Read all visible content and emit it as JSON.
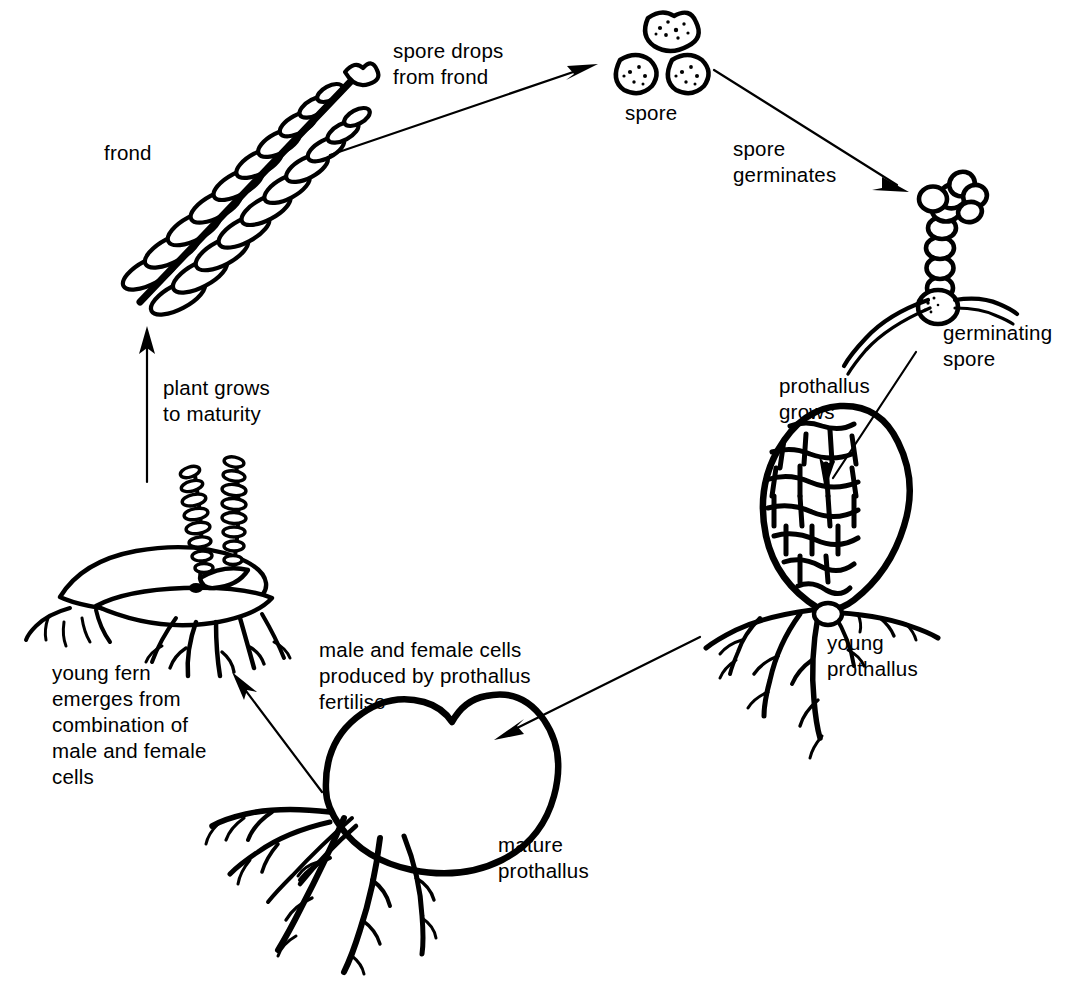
{
  "diagram": {
    "subject": "fern",
    "style": "black-and-white line drawing",
    "background_color": "#ffffff",
    "ink_color": "#000000",
    "direction": "clockwise",
    "stage_labels": {
      "frond": "frond",
      "spore": "spore",
      "germinating_spore_line1": "germinating",
      "germinating_spore_line2": "spore",
      "young_prothallus_line1": "young",
      "young_prothallus_line2": "prothallus",
      "mature_prothallus_line1": "mature",
      "mature_prothallus_line2": "prothallus",
      "young_fern_line1": "young fern",
      "young_fern_line2": "emerges from",
      "young_fern_line3": "combination of",
      "young_fern_line4": "male and female",
      "young_fern_line5": "cells"
    },
    "transition_labels": {
      "spore_drops_line1": "spore drops",
      "spore_drops_line2": "from frond",
      "spore_germinates_line1": "spore",
      "spore_germinates_line2": "germinates",
      "prothallus_grows_line1": "prothallus",
      "prothallus_grows_line2": "grows",
      "fertilise_line1": "male and female cells",
      "fertilise_line2": "produced by prothallus",
      "fertilise_line3": "fertilise",
      "plant_grows_line1": "plant grows",
      "plant_grows_line2": "to maturity"
    }
  }
}
